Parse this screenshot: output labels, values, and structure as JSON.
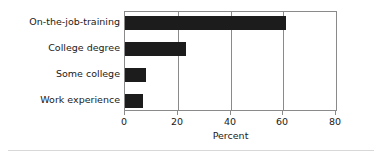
{
  "chart_data": {
    "type": "bar",
    "orientation": "horizontal",
    "title": "",
    "subtitle": "",
    "xlabel": "Percent",
    "ylabel": "",
    "categories": [
      "On-the-job-training",
      "College degree",
      "Some college",
      "Work experience"
    ],
    "values": [
      61,
      23,
      8,
      7
    ],
    "series": [
      {
        "name": "Percent",
        "values": [
          61,
          23,
          8,
          7
        ]
      }
    ],
    "xlim": [
      0,
      80
    ],
    "xticks": [
      0,
      20,
      40,
      60,
      80
    ],
    "xtick_labels": [
      "0",
      "20",
      "40",
      "60",
      "80"
    ],
    "grid": true,
    "grid_axis": "x",
    "legend": false,
    "legend_position": "none",
    "bar_color": "#1c1c1c",
    "grid_color": "#8a8a8a",
    "frame_color": "#8a8a8a",
    "background": "#ffffff",
    "text_color": "#1a1a1a"
  }
}
